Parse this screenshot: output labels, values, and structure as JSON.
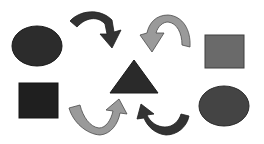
{
  "diagram": {
    "width": 264,
    "height": 144,
    "background": "#ffffff",
    "shapes": [
      {
        "id": "circle-top-left",
        "type": "ellipse",
        "cx": 37,
        "cy": 46,
        "rx": 25,
        "ry": 20,
        "fill": "#2c2c2c",
        "stroke": "#1a1a1a"
      },
      {
        "id": "square-bottom-left",
        "type": "rect",
        "x": 19,
        "y": 83,
        "w": 39,
        "h": 35,
        "fill": "#1f1f1f",
        "stroke": "#141414"
      },
      {
        "id": "triangle-center",
        "type": "triangle",
        "points": "134,60 110,93 158,93",
        "fill": "#2a2a2a",
        "stroke": "#1a1a1a"
      },
      {
        "id": "square-top-right",
        "type": "rect",
        "x": 205,
        "y": 35,
        "w": 39,
        "h": 33,
        "fill": "#6a6a6a",
        "stroke": "#3e3e3e"
      },
      {
        "id": "circle-bottom-right",
        "type": "ellipse",
        "cx": 224,
        "cy": 106,
        "rx": 25,
        "ry": 20,
        "fill": "#444444",
        "stroke": "#2a2a2a"
      }
    ],
    "arrows": [
      {
        "id": "arrow-top-left",
        "direction": "clockwise-down-right",
        "fill": "#333333",
        "stroke": "#1f1f1f"
      },
      {
        "id": "arrow-top-right",
        "direction": "counterclockwise-down-left",
        "fill": "#9a9a9a",
        "stroke": "#4a4a4a"
      },
      {
        "id": "arrow-bottom-left",
        "direction": "up-right",
        "fill": "#9a9a9a",
        "stroke": "#4a4a4a"
      },
      {
        "id": "arrow-bottom-right",
        "direction": "up-left",
        "fill": "#333333",
        "stroke": "#1f1f1f"
      }
    ]
  }
}
